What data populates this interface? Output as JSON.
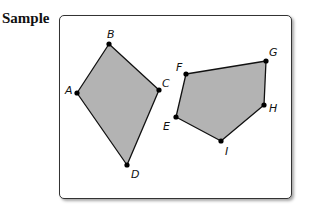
{
  "heading": "Sample",
  "colors": {
    "fill": "#b3b3b3",
    "stroke": "#111111",
    "vertex": "#000000",
    "frame_border": "#333333"
  },
  "polygons": [
    {
      "name": "quadrilateral-ABCD",
      "vertices": [
        {
          "label": "A",
          "x": 77,
          "y": 93,
          "lx": 65,
          "ly": 94
        },
        {
          "label": "B",
          "x": 109,
          "y": 44,
          "lx": 107,
          "ly": 38
        },
        {
          "label": "C",
          "x": 159,
          "y": 90,
          "lx": 162,
          "ly": 87
        },
        {
          "label": "D",
          "x": 127,
          "y": 165,
          "lx": 131,
          "ly": 178
        }
      ]
    },
    {
      "name": "pentagon-EFGHI",
      "vertices": [
        {
          "label": "F",
          "x": 186,
          "y": 74,
          "lx": 176,
          "ly": 71
        },
        {
          "label": "G",
          "x": 266,
          "y": 61,
          "lx": 269,
          "ly": 56
        },
        {
          "label": "H",
          "x": 264,
          "y": 105,
          "lx": 269,
          "ly": 112
        },
        {
          "label": "I",
          "x": 221,
          "y": 141,
          "lx": 225,
          "ly": 155
        },
        {
          "label": "E",
          "x": 176,
          "y": 117,
          "lx": 163,
          "ly": 130
        }
      ]
    }
  ]
}
